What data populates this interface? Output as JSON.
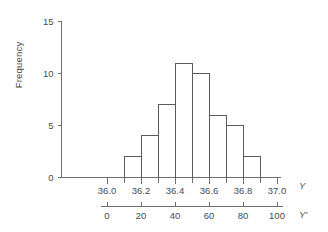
{
  "chart_data": {
    "type": "bar",
    "title": "",
    "subtitle": "",
    "xlabel": "Y",
    "ylabel": "Frequency",
    "categories": [
      "36.1-36.2",
      "36.2-36.3",
      "36.3-36.4",
      "36.4-36.5",
      "36.5-36.6",
      "36.6-36.7",
      "36.7-36.8",
      "36.8-36.9"
    ],
    "bin_edges": [
      36.1,
      36.2,
      36.3,
      36.4,
      36.5,
      36.6,
      36.7,
      36.8,
      36.9
    ],
    "values": [
      2,
      4,
      7,
      11,
      10,
      6,
      5,
      2
    ],
    "ylim": [
      0,
      15
    ],
    "yticks": [
      0,
      5,
      10,
      15
    ],
    "ytick_labels": [
      "0",
      "5",
      "10",
      "15"
    ],
    "xlim": [
      36.0,
      37.0
    ],
    "xticks": [
      36.0,
      36.2,
      36.4,
      36.6,
      36.8,
      37.0
    ],
    "xtick_labels": [
      "36.0",
      "36.2",
      "36.4",
      "36.6",
      "36.8",
      "37.0"
    ],
    "x_minor_step": 0.1,
    "secondary_axis": {
      "label": "Y'",
      "lim": [
        0,
        100
      ],
      "ticks": [
        0,
        20,
        40,
        60,
        80,
        100
      ],
      "tick_labels": [
        "0",
        "20",
        "40",
        "60",
        "80",
        "100"
      ]
    },
    "grid": false,
    "legend": null,
    "annotations": []
  },
  "axes": {
    "primary_name": "Y",
    "secondary_name": "Y'",
    "y_axis_title": "Frequency"
  }
}
